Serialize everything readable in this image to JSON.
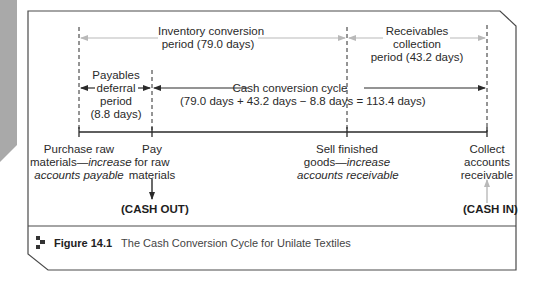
{
  "figure": {
    "number": "Figure 14.1",
    "title": "The Cash Conversion Cycle for Unilate Textiles"
  },
  "periods": {
    "inventory": {
      "line1": "Inventory conversion",
      "line2": "period (79.0 days)"
    },
    "receivables": {
      "line1": "Receivables",
      "line2": "collection",
      "line3": "period (43.2 days)"
    },
    "payables": {
      "line1": "Payables",
      "line2": "deferral",
      "line3": "period",
      "line4": "(8.8 days)"
    },
    "ccc": {
      "line1": "Cash conversion cycle",
      "line2": "(79.0 days + 43.2 days − 8.8 days = 113.4 days)"
    }
  },
  "events": {
    "purchase": {
      "line1": "Purchase raw",
      "line2a": "materials—",
      "line2b": "increase",
      "line3": "accounts payable"
    },
    "pay": {
      "line1": "Pay",
      "line2": "for raw",
      "line3": "materials"
    },
    "sell": {
      "line1": "Sell finished",
      "line2a": "goods—",
      "line2b": "increase",
      "line3": "accounts receivable"
    },
    "collect": {
      "line1": "Collect",
      "line2": "accounts",
      "line3": "receivable"
    }
  },
  "cash_flows": {
    "out": "(CASH OUT)",
    "in": "(CASH IN)"
  },
  "colors": {
    "frame": "#4a4a4a",
    "grey_arrow": "#b9b9b9",
    "dark_arrow": "#2a2a2a",
    "side_tab": "#a9a9a9"
  }
}
